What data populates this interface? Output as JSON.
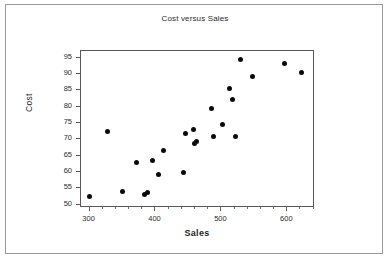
{
  "chart_data": {
    "type": "scatter",
    "title": "Cost versus Sales",
    "xlabel": "Sales",
    "ylabel": "Cost",
    "xlim": [
      287,
      642
    ],
    "ylim": [
      49,
      97
    ],
    "grid": false,
    "legend": null,
    "x_major_ticks": [
      300,
      400,
      500,
      600
    ],
    "x_major_tick_labels": [
      "300",
      "400",
      "500",
      "600"
    ],
    "x_minor_tick_step": 20,
    "y_major_ticks": [
      50,
      55,
      60,
      65,
      70,
      75,
      80,
      85,
      90,
      95
    ],
    "y_major_tick_labels": [
      "50",
      "55",
      "60",
      "65",
      "70",
      "75",
      "80",
      "85",
      "90",
      "95"
    ],
    "marker": "filled-circle",
    "marker_color": "#0b0b0b",
    "points": [
      {
        "x": 300,
        "y": 52.6
      },
      {
        "x": 327,
        "y": 72.4
      },
      {
        "x": 350,
        "y": 54.1
      },
      {
        "x": 371,
        "y": 63.0
      },
      {
        "x": 384,
        "y": 53.2
      },
      {
        "x": 388,
        "y": 53.8
      },
      {
        "x": 396,
        "y": 63.6
      },
      {
        "x": 404,
        "y": 59.1
      },
      {
        "x": 412,
        "y": 66.7
      },
      {
        "x": 443,
        "y": 59.8
      },
      {
        "x": 446,
        "y": 71.8
      },
      {
        "x": 457,
        "y": 72.9
      },
      {
        "x": 459,
        "y": 68.6
      },
      {
        "x": 462,
        "y": 69.2
      },
      {
        "x": 485,
        "y": 79.5
      },
      {
        "x": 488,
        "y": 70.9
      },
      {
        "x": 502,
        "y": 74.4
      },
      {
        "x": 513,
        "y": 85.5
      },
      {
        "x": 517,
        "y": 82.1
      },
      {
        "x": 521,
        "y": 71.0
      },
      {
        "x": 529,
        "y": 94.4
      },
      {
        "x": 547,
        "y": 89.2
      },
      {
        "x": 595,
        "y": 93.3
      },
      {
        "x": 621,
        "y": 90.5
      }
    ]
  },
  "figure": {
    "background_color": "#ffffff",
    "frame_color": "#585858",
    "border_color": "#9a9a9a"
  }
}
